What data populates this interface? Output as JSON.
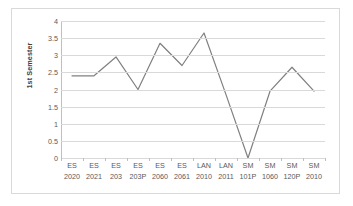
{
  "chart_data": {
    "type": "line",
    "title": "",
    "xlabel": "",
    "ylabel": "1st Semester",
    "ylim": [
      0,
      4
    ],
    "ytick_step": 0.5,
    "yticks": [
      "4",
      "3.5",
      "3",
      "2.5",
      "2",
      "1.5",
      "1",
      "0.5",
      "0"
    ],
    "ytick_values": [
      4,
      3.5,
      3,
      2.5,
      2,
      1.5,
      1,
      0.5,
      0
    ],
    "grid": "horizontal",
    "legend": "none",
    "line_color": "#808080",
    "categories": [
      "ES 2020",
      "ES 2021",
      "ES 203",
      "ES 203P",
      "ES 2060",
      "ES 2061",
      "LAN 2010",
      "LAN 2011",
      "SM 101P",
      "SM 1060",
      "SM 120P",
      "SM 2010"
    ],
    "category_lines": [
      {
        "l1": "ES",
        "l2": "2020"
      },
      {
        "l1": "ES",
        "l2": "2021"
      },
      {
        "l1": "ES",
        "l2": "203"
      },
      {
        "l1": "ES",
        "l2": "203P"
      },
      {
        "l1": "ES",
        "l2": "2060"
      },
      {
        "l1": "ES",
        "l2": "2061"
      },
      {
        "l1": "LAN",
        "l2": "2010"
      },
      {
        "l1": "LAN",
        "l2": "2011"
      },
      {
        "l1": "SM",
        "l2": "101P"
      },
      {
        "l1": "SM",
        "l2": "1060"
      },
      {
        "l1": "SM",
        "l2": "120P"
      },
      {
        "l1": "SM",
        "l2": "2010"
      }
    ],
    "values": [
      2.4,
      2.4,
      2.95,
      2.0,
      3.35,
      2.7,
      3.65,
      1.85,
      0,
      1.95,
      2.65,
      1.95
    ]
  },
  "colors": {
    "line": "#808080",
    "grid": "#d9d9d9",
    "axis": "#bfbfbf",
    "frame_border": "#d9d9d9",
    "tick_text": "#595959",
    "axis_title_text": "#3f3f3f",
    "background": "#ffffff"
  }
}
